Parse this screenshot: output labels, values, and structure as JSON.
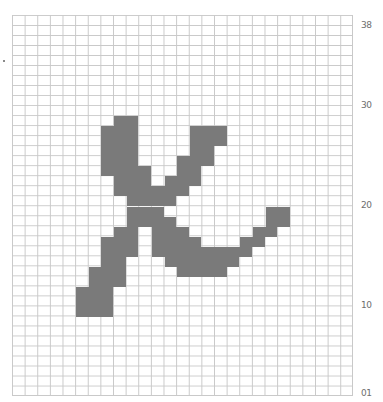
{
  "grid": {
    "columns": 27,
    "rows": 38,
    "line_color": "#c9c9c9",
    "fill_color": "#7a7a7a",
    "background": "#ffffff",
    "filled_runs": [
      {
        "row": 10,
        "cols": [
          [
            8,
            9
          ]
        ]
      },
      {
        "row": 11,
        "cols": [
          [
            7,
            9
          ],
          [
            14,
            16
          ]
        ]
      },
      {
        "row": 12,
        "cols": [
          [
            7,
            9
          ],
          [
            14,
            16
          ]
        ]
      },
      {
        "row": 13,
        "cols": [
          [
            7,
            9
          ],
          [
            14,
            15
          ]
        ]
      },
      {
        "row": 14,
        "cols": [
          [
            7,
            9
          ],
          [
            13,
            15
          ]
        ]
      },
      {
        "row": 15,
        "cols": [
          [
            7,
            10
          ],
          [
            13,
            14
          ]
        ]
      },
      {
        "row": 16,
        "cols": [
          [
            8,
            10
          ],
          [
            12,
            14
          ]
        ]
      },
      {
        "row": 17,
        "cols": [
          [
            8,
            13
          ]
        ]
      },
      {
        "row": 18,
        "cols": [
          [
            9,
            12
          ]
        ]
      },
      {
        "row": 19,
        "cols": [
          [
            9,
            11
          ],
          [
            20,
            21
          ]
        ]
      },
      {
        "row": 20,
        "cols": [
          [
            9,
            12
          ],
          [
            20,
            21
          ]
        ]
      },
      {
        "row": 21,
        "cols": [
          [
            8,
            9
          ],
          [
            11,
            13
          ],
          [
            19,
            20
          ]
        ]
      },
      {
        "row": 22,
        "cols": [
          [
            7,
            9
          ],
          [
            11,
            14
          ],
          [
            18,
            19
          ]
        ]
      },
      {
        "row": 23,
        "cols": [
          [
            7,
            9
          ],
          [
            11,
            18
          ]
        ]
      },
      {
        "row": 24,
        "cols": [
          [
            7,
            8
          ],
          [
            12,
            17
          ]
        ]
      },
      {
        "row": 25,
        "cols": [
          [
            6,
            8
          ],
          [
            13,
            16
          ]
        ]
      },
      {
        "row": 26,
        "cols": [
          [
            6,
            8
          ]
        ]
      },
      {
        "row": 27,
        "cols": [
          [
            5,
            7
          ]
        ]
      },
      {
        "row": 28,
        "cols": [
          [
            5,
            7
          ]
        ]
      },
      {
        "row": 29,
        "cols": [
          [
            5,
            7
          ]
        ]
      }
    ]
  },
  "row_labels": [
    {
      "text": "38",
      "top": 20
    },
    {
      "text": "30",
      "top": 100
    },
    {
      "text": "20",
      "top": 200
    },
    {
      "text": "10",
      "top": 300
    },
    {
      "text": "01",
      "top": 388
    }
  ]
}
